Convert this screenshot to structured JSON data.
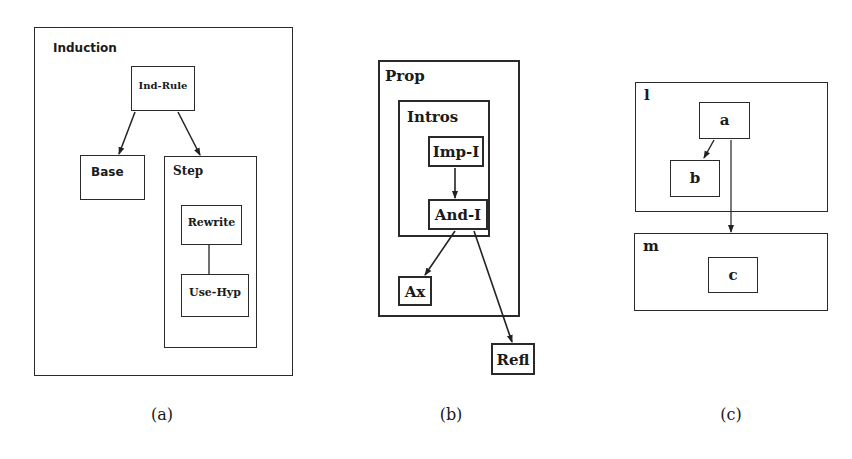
{
  "figures": {
    "a": {
      "caption": "(a)",
      "outer": {
        "label": "Induction"
      },
      "nodes": {
        "ind_rule": "Ind-Rule",
        "base": "Base",
        "step": "Step",
        "rewrite": "Rewrite",
        "use_hyp": "Use-Hyp"
      },
      "edges": [
        {
          "from": "Ind-Rule",
          "to": "Base",
          "type": "arrow"
        },
        {
          "from": "Ind-Rule",
          "to": "Step",
          "type": "arrow"
        },
        {
          "from": "Rewrite",
          "to": "Use-Hyp",
          "type": "line"
        }
      ]
    },
    "b": {
      "caption": "(b)",
      "outer": {
        "label": "Prop"
      },
      "nodes": {
        "intros": "Intros",
        "imp_i": "Imp-I",
        "and_i": "And-I",
        "ax": "Ax",
        "refl": "Refl"
      },
      "edges": [
        {
          "from": "Imp-I",
          "to": "And-I",
          "type": "arrow"
        },
        {
          "from": "And-I",
          "to": "Ax",
          "type": "arrow"
        },
        {
          "from": "And-I",
          "to": "Refl",
          "type": "arrow"
        }
      ]
    },
    "c": {
      "caption": "(c)",
      "nodes": {
        "l": "l",
        "a": "a",
        "b": "b",
        "m": "m",
        "c": "c"
      },
      "edges": [
        {
          "from": "a",
          "to": "b",
          "type": "arrow"
        },
        {
          "from": "a",
          "to": "m",
          "type": "arrow"
        }
      ]
    }
  }
}
